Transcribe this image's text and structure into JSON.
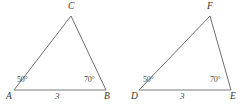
{
  "figure": {
    "background_color": "#ffffff",
    "line_color": "#6f6f6f",
    "text_color": "#3b3b3b",
    "degree_symbol": "°"
  },
  "triangles": [
    {
      "id": "triangle-abc",
      "vertices": {
        "left": {
          "label": "A",
          "x": 14,
          "y": 90
        },
        "right": {
          "label": "B",
          "x": 106,
          "y": 90
        },
        "apex": {
          "label": "C",
          "x": 71,
          "y": 16
        }
      },
      "angles": {
        "left": {
          "value": "50",
          "text": "50°"
        },
        "right": {
          "value": "70",
          "text": "70°"
        }
      },
      "base": {
        "length_label": "3",
        "label_x": 57,
        "label_y": 93
      }
    },
    {
      "id": "triangle-def",
      "vertices": {
        "left": {
          "label": "D",
          "x": 139,
          "y": 90
        },
        "right": {
          "label": "E",
          "x": 231,
          "y": 90
        },
        "apex": {
          "label": "F",
          "x": 210,
          "y": 16
        }
      },
      "angles": {
        "left": {
          "value": "50",
          "text": "50°"
        },
        "right": {
          "value": "70",
          "text": "70°"
        }
      },
      "base": {
        "length_label": "3",
        "label_x": 182,
        "label_y": 93
      }
    }
  ]
}
